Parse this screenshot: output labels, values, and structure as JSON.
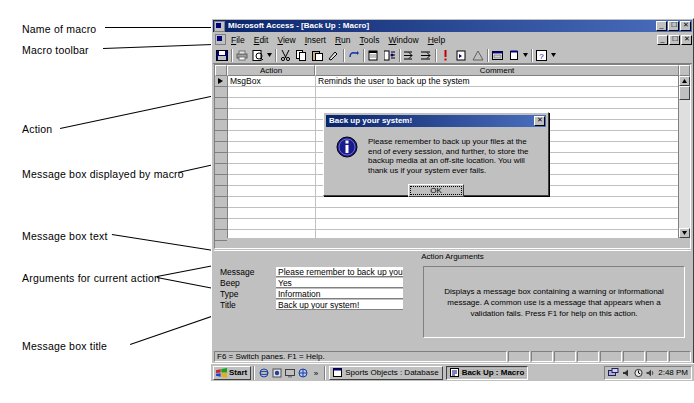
{
  "annotations": [
    {
      "id": "name-of-macro",
      "label": "Name of macro"
    },
    {
      "id": "macro-toolbar",
      "label": "Macro toolbar"
    },
    {
      "id": "action",
      "label": "Action"
    },
    {
      "id": "message-box",
      "label": "Message box displayed by macro"
    },
    {
      "id": "message-box-text",
      "label": "Message box text"
    },
    {
      "id": "arguments",
      "label": "Arguments for current action"
    },
    {
      "id": "message-box-title",
      "label": "Message box title"
    }
  ],
  "window": {
    "app_title": "Microsoft Access",
    "document_title": "[Back Up : Macro]",
    "title_full": "Microsoft Access - [Back Up : Macro]",
    "controls": [
      "minimize",
      "restore",
      "close"
    ],
    "menu": [
      {
        "label": "File",
        "accel": "F"
      },
      {
        "label": "Edit",
        "accel": "E"
      },
      {
        "label": "View",
        "accel": "V"
      },
      {
        "label": "Insert",
        "accel": "I"
      },
      {
        "label": "Run",
        "accel": "R"
      },
      {
        "label": "Tools",
        "accel": "T"
      },
      {
        "label": "Window",
        "accel": "W"
      },
      {
        "label": "Help",
        "accel": "H"
      }
    ],
    "toolbar_icons": [
      "save-icon",
      "print-icon",
      "print-preview-icon",
      "spelling-icon",
      "cut-icon",
      "copy-icon",
      "paste-icon",
      "format-painter-icon",
      "undo-icon",
      "macro-names-icon",
      "conditions-icon",
      "insert-rows-icon",
      "delete-rows-icon",
      "run-icon",
      "single-step-icon",
      "build-icon",
      "database-window-icon",
      "new-object-icon",
      "help-icon"
    ]
  },
  "grid": {
    "columns": [
      "Action",
      "Comment"
    ],
    "rows": [
      {
        "action": "MsgBox",
        "comment": "Reminds the user to back up the system",
        "selected": true
      }
    ],
    "empty_rows": 14
  },
  "action_arguments": {
    "title": "Action Arguments",
    "fields": [
      {
        "label": "Message",
        "value": "Please remember to back up your fil"
      },
      {
        "label": "Beep",
        "value": "Yes"
      },
      {
        "label": "Type",
        "value": "Information"
      },
      {
        "label": "Title",
        "value": "Back up your system!"
      }
    ],
    "help_text": "Displays a message box containing a warning or informational message. A common use is a message that appears when a validation fails. Press F1 for help on this action."
  },
  "dialog": {
    "title": "Back up your system!",
    "icon": "information-icon",
    "message": "Please remember to back up your files at the end of every session, and further, to store the backup media at an off-site location. You will thank us if your system ever fails.",
    "ok_label": "OK",
    "close_label": "×"
  },
  "status_bar": {
    "text": "F6 = Switch panes.  F1 = Help."
  },
  "taskbar": {
    "start_label": "Start",
    "quick_launch": [
      "ie-icon",
      "outlook-icon",
      "show-desktop-icon",
      "channels-icon",
      "more-icon"
    ],
    "buttons": [
      {
        "label": "Sports Objects : Database",
        "icon": "database-icon",
        "active": false
      },
      {
        "label": "Back Up : Macro",
        "icon": "macro-icon",
        "active": true
      }
    ],
    "tray_icons": [
      "network-icon",
      "volume-icon",
      "scheduler-icon",
      "speaker-icon"
    ],
    "clock": "2:48 PM"
  },
  "colors": {
    "title_active": "#0a246a",
    "face": "#c0c0c0",
    "shadow": "#808080",
    "window": "#ffffff"
  }
}
